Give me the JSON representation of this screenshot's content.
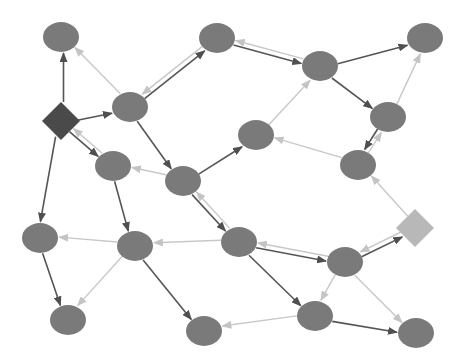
{
  "diagram": {
    "type": "directed-graph",
    "width": 471,
    "height": 363,
    "colors": {
      "background": "#ffffff",
      "node_fill": "#7a7a7a",
      "diamond_dark": "#4a4a4a",
      "diamond_light": "#b8b8b8",
      "edge_dark": "#555555",
      "edge_light": "#c8c8c8"
    },
    "nodes": [
      {
        "id": "A",
        "shape": "ellipse",
        "x": 61,
        "y": 37
      },
      {
        "id": "D1",
        "shape": "diamond",
        "x": 61,
        "y": 121,
        "tone": "dark"
      },
      {
        "id": "B",
        "shape": "ellipse",
        "x": 130,
        "y": 107
      },
      {
        "id": "C",
        "shape": "ellipse",
        "x": 217,
        "y": 38
      },
      {
        "id": "E",
        "shape": "ellipse",
        "x": 320,
        "y": 66
      },
      {
        "id": "F",
        "shape": "ellipse",
        "x": 425,
        "y": 38
      },
      {
        "id": "G",
        "shape": "ellipse",
        "x": 388,
        "y": 117
      },
      {
        "id": "H",
        "shape": "ellipse",
        "x": 256,
        "y": 135
      },
      {
        "id": "I",
        "shape": "ellipse",
        "x": 358,
        "y": 165
      },
      {
        "id": "J",
        "shape": "ellipse",
        "x": 113,
        "y": 166
      },
      {
        "id": "K",
        "shape": "ellipse",
        "x": 183,
        "y": 181
      },
      {
        "id": "D2",
        "shape": "diamond",
        "x": 415,
        "y": 228,
        "tone": "light"
      },
      {
        "id": "L",
        "shape": "ellipse",
        "x": 40,
        "y": 238
      },
      {
        "id": "M",
        "shape": "ellipse",
        "x": 135,
        "y": 246
      },
      {
        "id": "N",
        "shape": "ellipse",
        "x": 239,
        "y": 242
      },
      {
        "id": "O",
        "shape": "ellipse",
        "x": 345,
        "y": 262
      },
      {
        "id": "P",
        "shape": "ellipse",
        "x": 68,
        "y": 320
      },
      {
        "id": "Q",
        "shape": "ellipse",
        "x": 204,
        "y": 331
      },
      {
        "id": "R",
        "shape": "ellipse",
        "x": 315,
        "y": 316
      },
      {
        "id": "S",
        "shape": "ellipse",
        "x": 416,
        "y": 333
      }
    ],
    "edges": [
      {
        "from": "D1",
        "to": "A",
        "style": "dark"
      },
      {
        "from": "D1",
        "to": "B",
        "style": "dark"
      },
      {
        "from": "D1",
        "to": "J",
        "style": "dark"
      },
      {
        "from": "D1",
        "to": "L",
        "style": "dark"
      },
      {
        "from": "B",
        "to": "C",
        "style": "dark"
      },
      {
        "from": "B",
        "to": "K",
        "style": "dark"
      },
      {
        "from": "C",
        "to": "E",
        "style": "dark"
      },
      {
        "from": "E",
        "to": "F",
        "style": "dark"
      },
      {
        "from": "E",
        "to": "G",
        "style": "dark"
      },
      {
        "from": "G",
        "to": "I",
        "style": "dark"
      },
      {
        "from": "K",
        "to": "H",
        "style": "dark"
      },
      {
        "from": "K",
        "to": "N",
        "style": "dark"
      },
      {
        "from": "J",
        "to": "M",
        "style": "dark"
      },
      {
        "from": "L",
        "to": "P",
        "style": "dark"
      },
      {
        "from": "M",
        "to": "Q",
        "style": "dark"
      },
      {
        "from": "N",
        "to": "O",
        "style": "dark"
      },
      {
        "from": "N",
        "to": "R",
        "style": "dark"
      },
      {
        "from": "O",
        "to": "D2",
        "style": "dark"
      },
      {
        "from": "R",
        "to": "S",
        "style": "dark"
      },
      {
        "from": "B",
        "to": "A",
        "style": "light"
      },
      {
        "from": "J",
        "to": "D1",
        "style": "light"
      },
      {
        "from": "C",
        "to": "B",
        "style": "light"
      },
      {
        "from": "E",
        "to": "C",
        "style": "light"
      },
      {
        "from": "H",
        "to": "E",
        "style": "light"
      },
      {
        "from": "G",
        "to": "F",
        "style": "light"
      },
      {
        "from": "I",
        "to": "G",
        "style": "light"
      },
      {
        "from": "I",
        "to": "H",
        "style": "light"
      },
      {
        "from": "D2",
        "to": "I",
        "style": "light"
      },
      {
        "from": "D2",
        "to": "O",
        "style": "light"
      },
      {
        "from": "K",
        "to": "J",
        "style": "light"
      },
      {
        "from": "N",
        "to": "K",
        "style": "light"
      },
      {
        "from": "M",
        "to": "L",
        "style": "light"
      },
      {
        "from": "M",
        "to": "P",
        "style": "light"
      },
      {
        "from": "N",
        "to": "M",
        "style": "light"
      },
      {
        "from": "O",
        "to": "N",
        "style": "light"
      },
      {
        "from": "O",
        "to": "R",
        "style": "light"
      },
      {
        "from": "O",
        "to": "S",
        "style": "light"
      },
      {
        "from": "R",
        "to": "Q",
        "style": "light"
      }
    ]
  }
}
